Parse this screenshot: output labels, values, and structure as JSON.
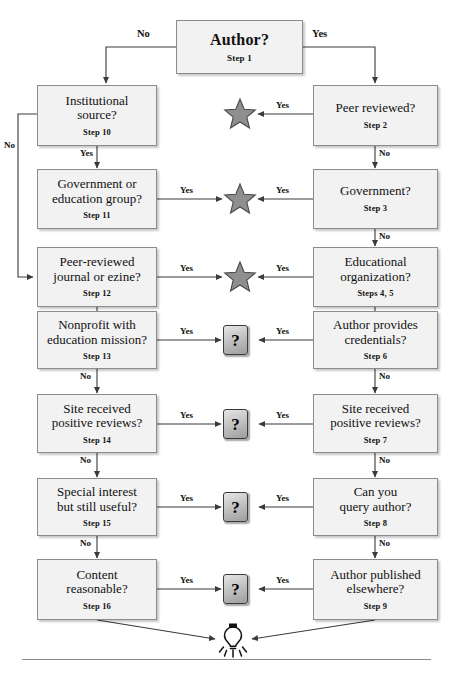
{
  "colors": {
    "box_fill": "#f2f2f2",
    "box_border": "#8c8c8c",
    "star_fill": "#8f8f8f",
    "star_stroke": "#4a4a4a",
    "line": "#3a3a3a",
    "text": "#111111"
  },
  "root": {
    "question": "Author?",
    "step": "Step 1"
  },
  "labels": {
    "yes": "Yes",
    "no": "No",
    "root_yes": "Yes",
    "root_no": "No"
  },
  "right_column": [
    {
      "question": "Peer reviewed?",
      "step": "Step 2",
      "yes_target": "star",
      "no_label": "No",
      "yes_label": "Yes"
    },
    {
      "question": "Government?",
      "step": "Step 3",
      "yes_target": "star",
      "no_label": "No",
      "yes_label": "Yes"
    },
    {
      "question": "Educational\norganization?",
      "step": "Steps 4, 5",
      "yes_target": "star",
      "no_label": "No",
      "yes_label": "Yes"
    },
    {
      "question": "Author provides\ncredentials?",
      "step": "Step 6",
      "yes_target": "question",
      "no_label": "No",
      "yes_label": "Yes"
    },
    {
      "question": "Site received\npositive reviews?",
      "step": "Step 7",
      "yes_target": "question",
      "no_label": "No",
      "yes_label": "Yes"
    },
    {
      "question": "Can you\nquery author?",
      "step": "Step 8",
      "yes_target": "question",
      "no_label": "No",
      "yes_label": "Yes"
    },
    {
      "question": "Author published\nelsewhere?",
      "step": "Step 9",
      "yes_target": "question",
      "no_label": "",
      "yes_label": "Yes"
    }
  ],
  "left_column": [
    {
      "question": "Institutional\nsource?",
      "step": "Step 10",
      "yes_target": "down",
      "no_label": "No",
      "yes_label": "Yes"
    },
    {
      "question": "Government or\neducation group?",
      "step": "Step 11",
      "yes_target": "star",
      "no_label": "",
      "yes_label": "Yes"
    },
    {
      "question": "Peer-reviewed\njournal or ezine?",
      "step": "Step 12",
      "yes_target": "star",
      "no_label": "No",
      "yes_label": "Yes"
    },
    {
      "question": "Nonprofit with\neducation mission?",
      "step": "Step 13",
      "yes_target": "question",
      "no_label": "No",
      "yes_label": "Yes"
    },
    {
      "question": "Site received\npositive reviews?",
      "step": "Step 14",
      "yes_target": "question",
      "no_label": "No",
      "yes_label": "Yes"
    },
    {
      "question": "Special interest\nbut still useful?",
      "step": "Step 15",
      "yes_target": "question",
      "no_label": "No",
      "yes_label": "Yes"
    },
    {
      "question": "Content\nreasonable?",
      "step": "Step 16",
      "yes_target": "question",
      "no_label": "",
      "yes_label": "Yes"
    }
  ],
  "middle_markers": [
    {
      "type": "star",
      "row": 0
    },
    {
      "type": "star",
      "row": 1
    },
    {
      "type": "star",
      "row": 2
    },
    {
      "type": "question",
      "row": 3,
      "glyph": "?"
    },
    {
      "type": "question",
      "row": 4,
      "glyph": "?"
    },
    {
      "type": "question",
      "row": 5,
      "glyph": "?"
    },
    {
      "type": "question",
      "row": 6,
      "glyph": "?"
    }
  ],
  "terminal": {
    "icon": "lightbulb-icon"
  }
}
